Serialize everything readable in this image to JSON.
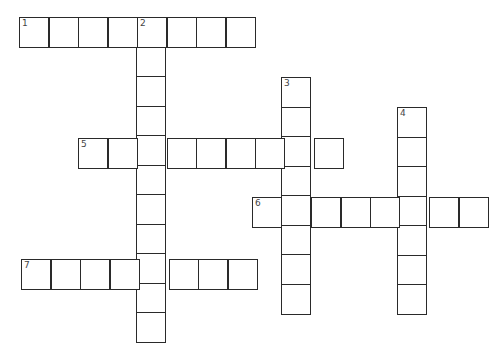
{
  "puzzle": {
    "type": "crossword",
    "cell_size": 29.5,
    "colors": {
      "border": "#2a2a2a",
      "fill": "#ffffff",
      "number": "#444444"
    },
    "entries": [
      {
        "number": "1",
        "direction": "across",
        "x": 19,
        "y": 17,
        "length": 8
      },
      {
        "number": "2",
        "direction": "down",
        "x": 136,
        "y": 17,
        "length": 11
      },
      {
        "number": "3",
        "direction": "down",
        "x": 281,
        "y": 77,
        "length": 8
      },
      {
        "number": "4",
        "direction": "down",
        "x": 397,
        "y": 107,
        "length": 7
      },
      {
        "number": "5",
        "direction": "across",
        "x": 78,
        "y": 138,
        "length": 9
      },
      {
        "number": "6",
        "direction": "across",
        "x": 252,
        "y": 197,
        "length": 8
      },
      {
        "number": "7",
        "direction": "across",
        "x": 21,
        "y": 259,
        "length": 8
      }
    ]
  }
}
